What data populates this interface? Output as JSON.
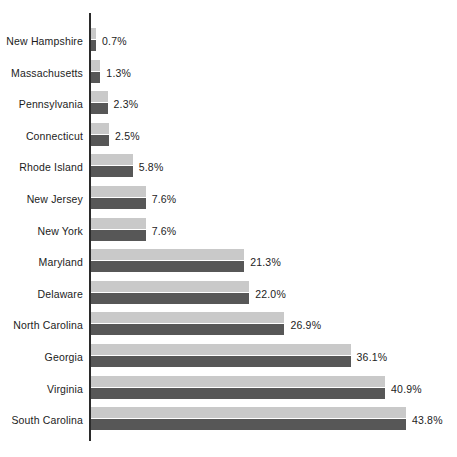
{
  "chart_data": {
    "type": "bar",
    "orientation": "horizontal",
    "title": "",
    "subtitle": "",
    "xlabel": "",
    "ylabel": "",
    "grid": false,
    "legend": "none",
    "xlim": [
      0,
      43.8
    ],
    "value_suffix": "%",
    "categories": [
      "New Hampshire",
      "Massachusetts",
      "Pennsylvania",
      "Connecticut",
      "Rhode Island",
      "New Jersey",
      "New York",
      "Maryland",
      "Delaware",
      "North Carolina",
      "Georgia",
      "Virginia",
      "South Carolina"
    ],
    "values": [
      0.7,
      1.3,
      2.3,
      2.5,
      5.8,
      7.6,
      7.6,
      21.3,
      22.0,
      26.9,
      36.1,
      40.9,
      43.8
    ],
    "value_labels": [
      "0.7%",
      "1.3%",
      "2.3%",
      "2.5%",
      "5.8%",
      "7.6%",
      "7.6%",
      "21.3%",
      "22.0%",
      "26.9%",
      "36.1%",
      "40.9%",
      "43.8%"
    ],
    "series": [
      {
        "name": "light-band",
        "color": "#c9c9c9",
        "values": [
          0.7,
          1.3,
          2.3,
          2.5,
          5.8,
          7.6,
          7.6,
          21.3,
          22.0,
          26.9,
          36.1,
          40.9,
          43.8
        ]
      },
      {
        "name": "dark-band",
        "color": "#575757",
        "values": [
          0.7,
          1.3,
          2.3,
          2.5,
          5.8,
          7.6,
          7.6,
          21.3,
          22.0,
          26.9,
          36.1,
          40.9,
          43.8
        ]
      }
    ],
    "colors": {
      "light_bar": "#c9c9c9",
      "dark_bar": "#575757",
      "axis": "#2b2b2b",
      "text": "#1c1c1c",
      "background": "#ffffff"
    }
  }
}
